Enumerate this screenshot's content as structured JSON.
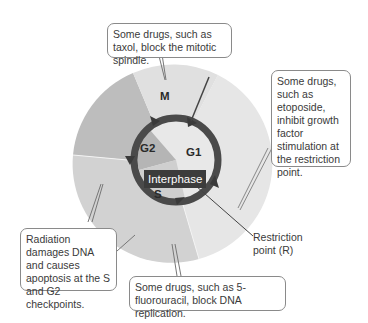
{
  "diagram": {
    "phases": [
      {
        "id": "M",
        "label": "M"
      },
      {
        "id": "G1",
        "label": "G1"
      },
      {
        "id": "G2",
        "label": "G2"
      },
      {
        "id": "S",
        "label": "S"
      }
    ],
    "center_label": "Interphase",
    "restriction_point_label_line1": "Restriction",
    "restriction_point_label_line2": "point (R)",
    "callouts": {
      "mitotic": "Some drugs, such as taxol, block the mitotic spindle.",
      "restriction": "Some drugs, such as etoposide, inhibit growth factor stimulation at the restriction point.",
      "radiation": "Radiation damages DNA and causes apoptosis at the S and G2 checkpoints.",
      "replication": "Some drugs, such as 5-fluorouracil, block DNA replication."
    },
    "colors": {
      "m_sector": "#e2e2e2",
      "g1_sector": "#e6e6e6",
      "g2_sector": "#b9b9b9",
      "s_sector": "#d0d0d0",
      "ring": "#4a4a4a",
      "interphase_bg": "#3c3c3c"
    }
  }
}
